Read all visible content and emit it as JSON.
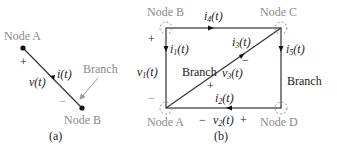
{
  "figure_a": {
    "node_top": "Node A",
    "node_bottom": "Node B",
    "plus": "+",
    "minus": "−",
    "voltage": "v(t)",
    "current": "i(t)",
    "branch_label": "Branch",
    "caption": "(a)"
  },
  "figure_b": {
    "node_top_left": "Node B",
    "node_top_right": "Node C",
    "node_bottom_left": "Node A",
    "node_bottom_right": "Node D",
    "left_plus": "+",
    "left_minus": "−",
    "v1": "v",
    "v1_sub": "1",
    "i1": "i",
    "i1_sub": "1",
    "i4": "i",
    "i4_sub": "4",
    "i3": "i",
    "i3_sub": "3",
    "i5": "i",
    "i5_sub": "5",
    "v3": "v",
    "v3_sub": "3",
    "i2": "i",
    "i2_sub": "2",
    "v2": "v",
    "v2_sub": "2",
    "t_suffix": "(t)",
    "diag_plus": "+",
    "diag_minus": "−",
    "bottom_minus": "−",
    "bottom_plus": "+",
    "branch_center": "Branch",
    "branch_right": "Branch",
    "caption": "(b)"
  },
  "colors": {
    "line": "#333333",
    "label_gray": "#8a8a8a",
    "text": "#222222",
    "pointer": "#9a9a9a"
  }
}
